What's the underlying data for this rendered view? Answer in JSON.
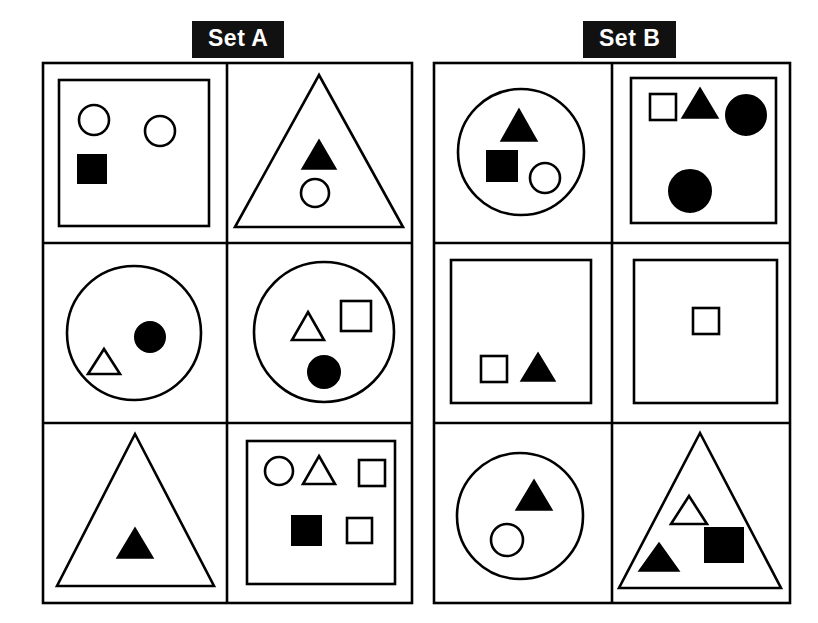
{
  "page": {
    "background_color": "#ffffff",
    "stroke_color": "#000000",
    "fill_color": "#000000",
    "label_background": "#111111",
    "label_text_color": "#ffffff",
    "width": 818,
    "height": 623
  },
  "sets": [
    {
      "id": "set-a",
      "label": "Set A",
      "label_position": {
        "x": 192,
        "y": 21
      },
      "grid": {
        "x": 36,
        "y": 56,
        "width": 380,
        "height": 550,
        "rows": 3,
        "cols": 2
      },
      "cells": [
        {
          "id": "a1",
          "row": 1,
          "col": 1,
          "container": "square",
          "contents": [
            {
              "shape": "circle",
              "fill": "open"
            },
            {
              "shape": "circle",
              "fill": "open"
            },
            {
              "shape": "square",
              "fill": "filled"
            }
          ],
          "counts": {
            "circle_open": 2,
            "circle_filled": 0,
            "square_open": 0,
            "square_filled": 1,
            "triangle_open": 0,
            "triangle_filled": 0,
            "total": 3
          }
        },
        {
          "id": "a2",
          "row": 1,
          "col": 2,
          "container": "triangle",
          "contents": [
            {
              "shape": "triangle",
              "fill": "filled"
            },
            {
              "shape": "circle",
              "fill": "open"
            }
          ],
          "counts": {
            "circle_open": 1,
            "circle_filled": 0,
            "square_open": 0,
            "square_filled": 0,
            "triangle_open": 0,
            "triangle_filled": 1,
            "total": 2
          }
        },
        {
          "id": "a3",
          "row": 2,
          "col": 1,
          "container": "circle",
          "contents": [
            {
              "shape": "circle",
              "fill": "filled"
            },
            {
              "shape": "triangle",
              "fill": "open"
            }
          ],
          "counts": {
            "circle_open": 0,
            "circle_filled": 1,
            "square_open": 0,
            "square_filled": 0,
            "triangle_open": 1,
            "triangle_filled": 0,
            "total": 2
          }
        },
        {
          "id": "a4",
          "row": 2,
          "col": 2,
          "container": "circle",
          "contents": [
            {
              "shape": "triangle",
              "fill": "open"
            },
            {
              "shape": "square",
              "fill": "open"
            },
            {
              "shape": "circle",
              "fill": "filled"
            }
          ],
          "counts": {
            "circle_open": 0,
            "circle_filled": 1,
            "square_open": 1,
            "square_filled": 0,
            "triangle_open": 1,
            "triangle_filled": 0,
            "total": 3
          }
        },
        {
          "id": "a5",
          "row": 3,
          "col": 1,
          "container": "triangle",
          "contents": [
            {
              "shape": "triangle",
              "fill": "filled"
            }
          ],
          "counts": {
            "circle_open": 0,
            "circle_filled": 0,
            "square_open": 0,
            "square_filled": 0,
            "triangle_open": 0,
            "triangle_filled": 1,
            "total": 1
          }
        },
        {
          "id": "a6",
          "row": 3,
          "col": 2,
          "container": "square",
          "contents": [
            {
              "shape": "circle",
              "fill": "open"
            },
            {
              "shape": "triangle",
              "fill": "open"
            },
            {
              "shape": "square",
              "fill": "open"
            },
            {
              "shape": "square",
              "fill": "filled"
            },
            {
              "shape": "square",
              "fill": "open"
            }
          ],
          "counts": {
            "circle_open": 1,
            "circle_filled": 0,
            "square_open": 2,
            "square_filled": 1,
            "triangle_open": 1,
            "triangle_filled": 0,
            "total": 5
          }
        }
      ]
    },
    {
      "id": "set-b",
      "label": "Set B",
      "label_position": {
        "x": 583,
        "y": 21
      },
      "grid": {
        "x": 427,
        "y": 56,
        "width": 368,
        "height": 550,
        "rows": 3,
        "cols": 2
      },
      "cells": [
        {
          "id": "b1",
          "row": 1,
          "col": 1,
          "container": "circle",
          "contents": [
            {
              "shape": "triangle",
              "fill": "filled"
            },
            {
              "shape": "square",
              "fill": "filled"
            },
            {
              "shape": "circle",
              "fill": "open"
            }
          ],
          "counts": {
            "circle_open": 1,
            "circle_filled": 0,
            "square_open": 0,
            "square_filled": 1,
            "triangle_open": 0,
            "triangle_filled": 1,
            "total": 3
          }
        },
        {
          "id": "b2",
          "row": 1,
          "col": 2,
          "container": "square",
          "contents": [
            {
              "shape": "square",
              "fill": "open"
            },
            {
              "shape": "triangle",
              "fill": "filled"
            },
            {
              "shape": "circle",
              "fill": "filled"
            },
            {
              "shape": "circle",
              "fill": "filled"
            }
          ],
          "counts": {
            "circle_open": 0,
            "circle_filled": 2,
            "square_open": 1,
            "square_filled": 0,
            "triangle_open": 0,
            "triangle_filled": 1,
            "total": 4
          }
        },
        {
          "id": "b3",
          "row": 2,
          "col": 1,
          "container": "square",
          "contents": [
            {
              "shape": "square",
              "fill": "open"
            },
            {
              "shape": "triangle",
              "fill": "filled"
            }
          ],
          "counts": {
            "circle_open": 0,
            "circle_filled": 0,
            "square_open": 1,
            "square_filled": 0,
            "triangle_open": 0,
            "triangle_filled": 1,
            "total": 2
          }
        },
        {
          "id": "b4",
          "row": 2,
          "col": 2,
          "container": "square",
          "contents": [
            {
              "shape": "square",
              "fill": "open"
            }
          ],
          "counts": {
            "circle_open": 0,
            "circle_filled": 0,
            "square_open": 1,
            "square_filled": 0,
            "triangle_open": 0,
            "triangle_filled": 0,
            "total": 1
          }
        },
        {
          "id": "b5",
          "row": 3,
          "col": 1,
          "container": "circle",
          "contents": [
            {
              "shape": "triangle",
              "fill": "filled"
            },
            {
              "shape": "circle",
              "fill": "open"
            }
          ],
          "counts": {
            "circle_open": 1,
            "circle_filled": 0,
            "square_open": 0,
            "square_filled": 0,
            "triangle_open": 0,
            "triangle_filled": 1,
            "total": 2
          }
        },
        {
          "id": "b6",
          "row": 3,
          "col": 2,
          "container": "triangle",
          "contents": [
            {
              "shape": "triangle",
              "fill": "open"
            },
            {
              "shape": "triangle",
              "fill": "filled"
            },
            {
              "shape": "square",
              "fill": "filled"
            }
          ],
          "counts": {
            "circle_open": 0,
            "circle_filled": 0,
            "square_open": 0,
            "square_filled": 1,
            "triangle_open": 1,
            "triangle_filled": 1,
            "total": 3
          }
        }
      ]
    }
  ]
}
